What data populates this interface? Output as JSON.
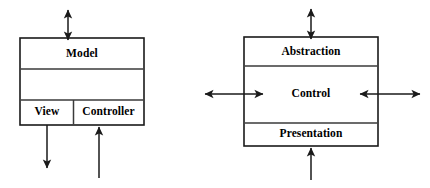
{
  "diagram": {
    "type": "architecture-pattern-comparison",
    "left_model": {
      "name": "MVC",
      "cells": [
        {
          "id": "model",
          "label": "Model"
        },
        {
          "id": "spacer",
          "label": ""
        },
        {
          "id": "view",
          "label": "View"
        },
        {
          "id": "controller",
          "label": "Controller"
        }
      ],
      "arrows": [
        {
          "id": "model-top",
          "direction": "double-vertical",
          "attached_to": "Model"
        },
        {
          "id": "view-bottom",
          "direction": "down",
          "attached_to": "View"
        },
        {
          "id": "controller-bottom",
          "direction": "up",
          "attached_to": "Controller"
        }
      ]
    },
    "right_model": {
      "name": "PAC",
      "cells": [
        {
          "id": "abstraction",
          "label": "Abstraction"
        },
        {
          "id": "control",
          "label": "Control"
        },
        {
          "id": "presentation",
          "label": "Presentation"
        }
      ],
      "arrows": [
        {
          "id": "abstraction-top",
          "direction": "double-vertical",
          "attached_to": "Abstraction"
        },
        {
          "id": "control-left",
          "direction": "double-horizontal",
          "attached_to": "Control"
        },
        {
          "id": "control-right",
          "direction": "double-horizontal",
          "attached_to": "Control"
        },
        {
          "id": "presentation-bottom",
          "direction": "up",
          "attached_to": "Presentation"
        }
      ]
    },
    "colors": {
      "stroke": "#1a1a1a",
      "divider": "#3a3a3a",
      "background": "#ffffff",
      "text": "#000000"
    }
  }
}
